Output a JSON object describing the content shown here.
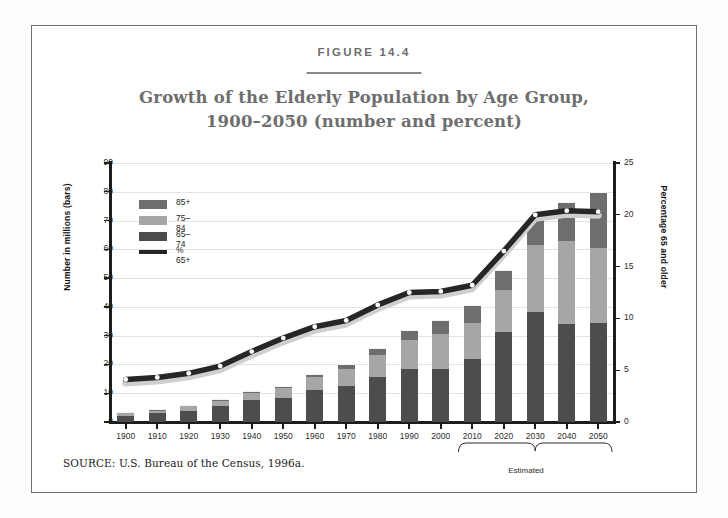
{
  "figure": {
    "label": "FIGURE 14.4",
    "title_line1": "Growth of the Elderly Population by Age Group,",
    "title_line2": "1900–2050 (number and percent)",
    "source": "SOURCE:  U.S. Bureau of the Census, 1996a.",
    "estimated_note": "Estimated"
  },
  "colors": {
    "bar_65_74": "#4d4d4d",
    "bar_75_84": "#a6a6a6",
    "bar_85_plus": "#6e6e6e",
    "line": "#262626",
    "marker": "#ffffff",
    "axis": "#1c1c1c",
    "grid": "#e3e3e3",
    "title": "#6e6e6e",
    "frame": "#6f6f6f"
  },
  "legend": {
    "position": "inside-top-left",
    "items": [
      {
        "label": "85+",
        "type": "swatch",
        "color": "#6e6e6e"
      },
      {
        "label": "75–84",
        "type": "swatch",
        "color": "#a6a6a6"
      },
      {
        "label": "65–74",
        "type": "swatch",
        "color": "#4d4d4d"
      },
      {
        "label": "% 65+",
        "type": "line",
        "color": "#262626"
      }
    ]
  },
  "chart_data": {
    "type": "bar",
    "subtype": "stacked-bar-with-line",
    "title": "Growth of the Elderly Population by Age Group, 1900–2050 (number and percent)",
    "xlabel": "",
    "ylabel": "Number in millions (bars)",
    "y2label": "Percentage 65 and older",
    "ylim": [
      0,
      90
    ],
    "y2lim": [
      0,
      25
    ],
    "yticks": [
      0,
      10,
      20,
      30,
      40,
      50,
      60,
      70,
      80,
      90
    ],
    "y2ticks": [
      0,
      5,
      10,
      15,
      20,
      25
    ],
    "grid": true,
    "categories": [
      "1900",
      "1910",
      "1920",
      "1930",
      "1940",
      "1950",
      "1960",
      "1970",
      "1980",
      "1990",
      "2000",
      "2010",
      "2020",
      "2030",
      "2040",
      "2050"
    ],
    "estimated_from": "2010",
    "series": [
      {
        "name": "65–74",
        "values": [
          2.2,
          3.0,
          4.0,
          5.4,
          7.5,
          8.4,
          11.0,
          12.4,
          15.6,
          18.4,
          18.4,
          21.8,
          31.4,
          38.3,
          34.1,
          34.4
        ]
      },
      {
        "name": "75–84",
        "values": [
          0.8,
          1.0,
          1.4,
          1.9,
          2.6,
          3.3,
          4.6,
          6.1,
          7.7,
          10.1,
          12.3,
          12.7,
          14.5,
          23.3,
          28.9,
          25.9
        ]
      },
      {
        "name": "85+",
        "values": [
          0.1,
          0.2,
          0.3,
          0.4,
          0.4,
          0.6,
          0.9,
          1.4,
          2.2,
          3.0,
          4.3,
          5.7,
          6.7,
          8.5,
          13.2,
          19.4
        ]
      },
      {
        "name": "% 65+",
        "values": [
          4.1,
          4.3,
          4.7,
          5.4,
          6.8,
          8.1,
          9.2,
          9.8,
          11.3,
          12.5,
          12.6,
          13.2,
          16.5,
          20.0,
          20.4,
          20.3
        ],
        "axis": "right",
        "type": "line"
      }
    ]
  }
}
